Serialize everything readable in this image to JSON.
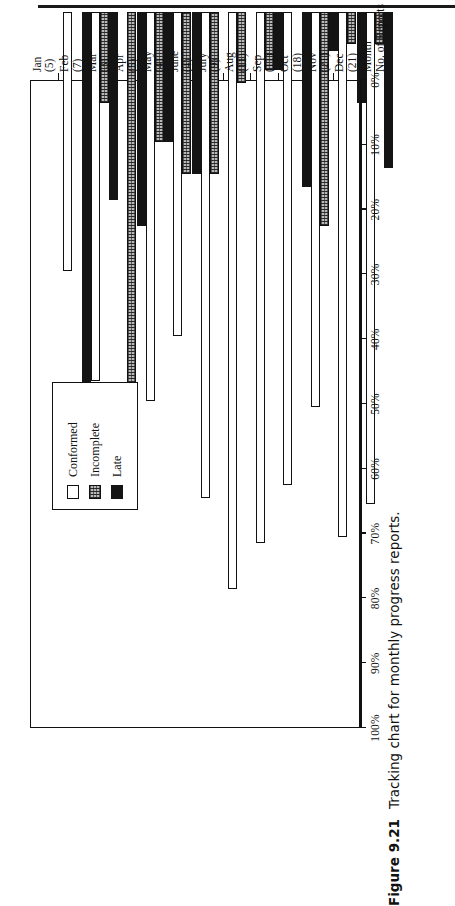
{
  "page": {
    "caption_number": "Figure 9.21",
    "caption_text": "Tracking chart for monthly progress reports."
  },
  "legend": {
    "items": [
      {
        "label": "Conformed",
        "key": "conformed",
        "swatch": "white-open-square"
      },
      {
        "label": "Incomplete",
        "key": "incomplete",
        "swatch": "gray-hatched-square"
      },
      {
        "label": "Late",
        "key": "late",
        "swatch": "black-filled-square"
      }
    ]
  },
  "axis_titles": {
    "category": "Month",
    "count": "No. of Reports"
  },
  "chart_data": {
    "type": "bar",
    "orientation": "horizontal",
    "title": "Tracking chart for monthly progress reports.",
    "xlabel": "",
    "ylabel": "",
    "grid": false,
    "legend_position": "inside-upper-middle",
    "ylim": [
      0,
      100
    ],
    "tick_labels": [
      "100%",
      "90%",
      "80%",
      "70%",
      "60%",
      "50%",
      "40%",
      "30%",
      "20%",
      "10%",
      "0%"
    ],
    "tick_values": [
      100,
      90,
      80,
      70,
      60,
      50,
      40,
      30,
      20,
      10,
      0
    ],
    "categories": [
      "Jan",
      "Feb",
      "Mar",
      "Apr",
      "May",
      "June",
      "July",
      "Aug",
      "Sep",
      "Oct",
      "Nov",
      "Dec"
    ],
    "category_counts": [
      "(5)",
      "(7)",
      "(3)",
      "(5)",
      "(4)",
      "(4)",
      "(9)",
      "(11)",
      "(11)",
      "(18)",
      "(21)",
      "(21)"
    ],
    "series": [
      {
        "name": "Conformed",
        "values": [
          40,
          57,
          0,
          60,
          50,
          75,
          89,
          82,
          73,
          61,
          81,
          76
        ]
      },
      {
        "name": "Incomplete",
        "values": [
          0,
          14,
          67,
          20,
          25,
          25,
          11,
          9,
          0,
          33,
          5,
          5
        ]
      },
      {
        "name": "Late",
        "values": [
          60,
          29,
          33,
          20,
          25,
          0,
          0,
          9,
          27,
          6,
          14,
          24
        ]
      }
    ]
  }
}
